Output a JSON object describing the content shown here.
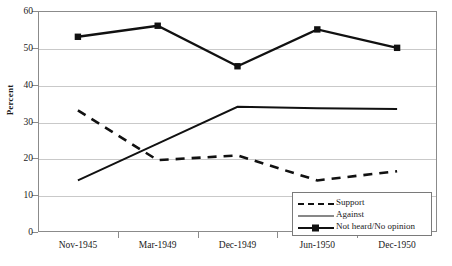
{
  "chart_data": {
    "type": "line",
    "title": "",
    "xlabel": "",
    "ylabel": "Percent",
    "categories": [
      "Nov-1945",
      "Mar-1949",
      "Dec-1949",
      "Jun-1950",
      "Dec-1950"
    ],
    "ylim": [
      0,
      60
    ],
    "yticks": [
      0,
      10,
      20,
      30,
      40,
      50,
      60
    ],
    "grid": true,
    "legend_position": "bottom-right",
    "series": [
      {
        "name": "Support",
        "style": "dashed",
        "marker": "none",
        "color": "#111111",
        "values": [
          33,
          19.5,
          20.8,
          14,
          16.5
        ]
      },
      {
        "name": "Against",
        "style": "solid",
        "marker": "none",
        "color": "#111111",
        "values": [
          14,
          24,
          34,
          33.6,
          33.4
        ]
      },
      {
        "name": "Not heard/No opinion",
        "style": "solid",
        "marker": "square",
        "color": "#111111",
        "values": [
          53,
          56,
          45,
          55,
          50
        ]
      }
    ]
  },
  "axis": {
    "y_title": "Percent",
    "y_tick_labels": [
      "0",
      "10",
      "20",
      "30",
      "40",
      "50",
      "60"
    ],
    "x_tick_labels": [
      "Nov-1945",
      "Mar-1949",
      "Dec-1949",
      "Jun-1950",
      "Dec-1950"
    ]
  },
  "legend": {
    "entries": [
      {
        "label": "Support"
      },
      {
        "label": "Against"
      },
      {
        "label": "Not heard/No opinion"
      }
    ]
  }
}
